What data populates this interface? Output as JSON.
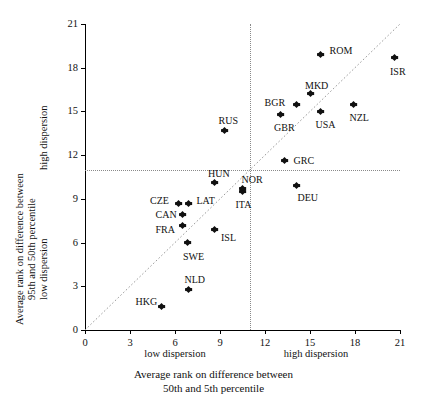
{
  "chart_data": {
    "type": "scatter",
    "title": "",
    "xlabel": "Average rank on difference between 50th and 5th percentile",
    "ylabel": "Average rank on difference between 95th and 50th percentile",
    "xlabel_line1": "Average rank on difference between",
    "xlabel_line2": "50th and 5th percentile",
    "ylabel_line1": "Average rank on difference between",
    "ylabel_line2": "95th and 50th percentile",
    "xlim": [
      0,
      21
    ],
    "ylim": [
      0,
      21
    ],
    "xticks": [
      0,
      3,
      6,
      9,
      12,
      15,
      18,
      21
    ],
    "yticks": [
      0,
      3,
      6,
      9,
      12,
      15,
      18,
      21
    ],
    "xticklabels": [
      "0",
      "3",
      "6",
      "9",
      "12",
      "15",
      "18",
      "21"
    ],
    "yticklabels": [
      "0",
      "3",
      "6",
      "9",
      "12",
      "15",
      "18",
      "21"
    ],
    "grid": false,
    "legend": "none",
    "x_zone_labels": [
      {
        "text": "low dispersion",
        "at_x": 6.0
      },
      {
        "text": "high dispersion",
        "at_x": 15.4
      }
    ],
    "y_zone_labels": [
      {
        "text": "low dispersion",
        "at_y": 5.5
      },
      {
        "text": "high dispersion",
        "at_y": 16.0
      }
    ],
    "reference_lines": {
      "vertical_x": 11.0,
      "horizontal_y": 11.0,
      "diagonal": "y = x"
    },
    "points": [
      {
        "label": "ROM",
        "x": 15.7,
        "y": 18.9,
        "lx": 9,
        "ly": -4
      },
      {
        "label": "ISR",
        "x": 20.6,
        "y": 18.7,
        "lx": -4,
        "ly": 14
      },
      {
        "label": "MKD",
        "x": 15.0,
        "y": 16.2,
        "lx": -5,
        "ly": -8
      },
      {
        "label": "BGR",
        "x": 14.1,
        "y": 15.5,
        "lx": -32,
        "ly": -1
      },
      {
        "label": "NZL",
        "x": 17.9,
        "y": 15.5,
        "lx": -4,
        "ly": 14
      },
      {
        "label": "USA",
        "x": 15.7,
        "y": 15.0,
        "lx": -5,
        "ly": 14
      },
      {
        "label": "GBR",
        "x": 13.0,
        "y": 14.8,
        "lx": -6,
        "ly": 14
      },
      {
        "label": "RUS",
        "x": 9.3,
        "y": 13.7,
        "lx": -6,
        "ly": -9
      },
      {
        "label": "GRC",
        "x": 13.3,
        "y": 11.6,
        "lx": 9,
        "ly": 0
      },
      {
        "label": "HUN",
        "x": 8.6,
        "y": 10.1,
        "lx": -6,
        "ly": -9
      },
      {
        "label": "DEU",
        "x": 14.1,
        "y": 9.9,
        "lx": 1,
        "ly": 12
      },
      {
        "label": "NOR",
        "x": 10.5,
        "y": 9.7,
        "lx": -1,
        "ly": -9
      },
      {
        "label": "ITA",
        "x": 10.5,
        "y": 9.5,
        "lx": -7,
        "ly": 13
      },
      {
        "label": "CZE",
        "x": 6.2,
        "y": 8.7,
        "lx": -28,
        "ly": -2
      },
      {
        "label": "LAT",
        "x": 6.9,
        "y": 8.7,
        "lx": 8,
        "ly": -2
      },
      {
        "label": "CAN",
        "x": 6.5,
        "y": 7.9,
        "lx": -27,
        "ly": 0
      },
      {
        "label": "FRA",
        "x": 6.5,
        "y": 7.2,
        "lx": -27,
        "ly": 5
      },
      {
        "label": "ISL",
        "x": 8.6,
        "y": 6.9,
        "lx": 7,
        "ly": 9
      },
      {
        "label": "SWE",
        "x": 6.8,
        "y": 6.0,
        "lx": -4,
        "ly": 14
      },
      {
        "label": "NLD",
        "x": 6.9,
        "y": 2.8,
        "lx": -4,
        "ly": -9
      },
      {
        "label": "HKG",
        "x": 5.1,
        "y": 1.6,
        "lx": -26,
        "ly": -5
      }
    ]
  }
}
